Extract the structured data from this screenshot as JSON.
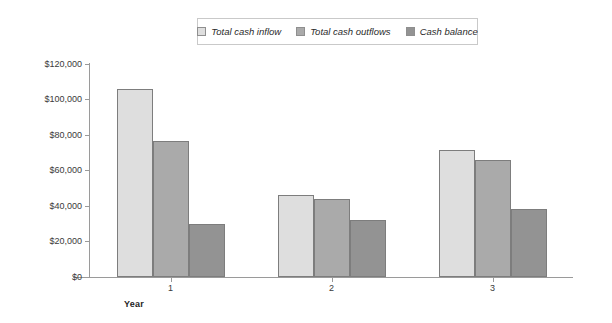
{
  "chart_data": {
    "type": "bar",
    "title": "",
    "subtitle": "",
    "xlabel": "Year",
    "ylabel": "",
    "categories": [
      "1",
      "2",
      "3"
    ],
    "ylim": [
      0,
      120000
    ],
    "ytick_values": [
      0,
      20000,
      40000,
      60000,
      80000,
      100000,
      120000
    ],
    "ytick_labels": [
      "$0",
      "$20,000",
      "$40,000",
      "$60,000",
      "$80,000",
      "$100,000",
      "$120,000"
    ],
    "grid": false,
    "legend_position": "top-center",
    "series": [
      {
        "name": "Total cash inflow",
        "color": "#dedede",
        "values": [
          105900,
          46200,
          71500
        ]
      },
      {
        "name": "Total cash outflows",
        "color": "#aaaaaa",
        "values": [
          76600,
          43900,
          65900
        ]
      },
      {
        "name": "Cash balance",
        "color": "#939393",
        "values": [
          29900,
          32100,
          38300
        ]
      }
    ],
    "axis_color": "#9a9a9a",
    "bar_border_color": "#7d7d7d",
    "text_color": "#3a3a3a",
    "background_color": "#ffffff"
  }
}
